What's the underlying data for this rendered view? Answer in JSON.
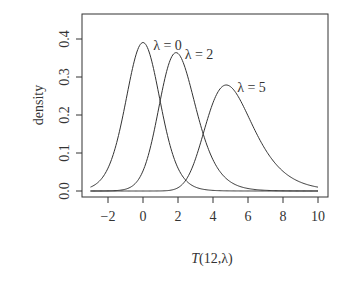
{
  "chart_data": {
    "type": "line",
    "title": "",
    "xlabel": "T(12,λ)",
    "ylabel": "density",
    "xlim": [
      -3.5,
      10.4
    ],
    "ylim": [
      -0.015,
      0.47
    ],
    "xticks": [
      "-2",
      "0",
      "2",
      "4",
      "6",
      "8",
      "10"
    ],
    "yticks": [
      "0.0",
      "0.1",
      "0.2",
      "0.3",
      "0.4"
    ],
    "grid": false,
    "legend": "none",
    "df": 12,
    "series": [
      {
        "name": "λ = 0",
        "ncp": 0,
        "peak_x": 0.0,
        "peak_y": 0.39,
        "x_range": [
          -3,
          10
        ]
      },
      {
        "name": "λ = 2",
        "ncp": 2,
        "peak_x": 2.0,
        "peak_y": 0.36,
        "x_range": [
          -3,
          10
        ]
      },
      {
        "name": "λ = 5",
        "ncp": 5,
        "peak_x": 4.8,
        "peak_y": 0.27,
        "x_range": [
          -3,
          10
        ]
      }
    ],
    "annotations": [
      {
        "text": "λ = 0",
        "x": 1.4,
        "y": 0.385
      },
      {
        "text": "λ = 2",
        "x": 3.2,
        "y": 0.36
      },
      {
        "text": "λ = 5",
        "x": 6.2,
        "y": 0.275
      }
    ]
  }
}
